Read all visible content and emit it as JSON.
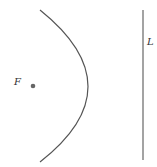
{
  "diagram": {
    "focus": {
      "label": "F",
      "x": 33,
      "y": 86
    },
    "directrix": {
      "label": "L",
      "x": 143,
      "y1": 10,
      "y2": 160
    },
    "parabola": {
      "top": [
        40,
        10
      ],
      "vertex": [
        88,
        87
      ],
      "bottom": [
        40,
        162
      ]
    },
    "colors": {
      "stroke": "#555555",
      "point": "#666666"
    }
  }
}
